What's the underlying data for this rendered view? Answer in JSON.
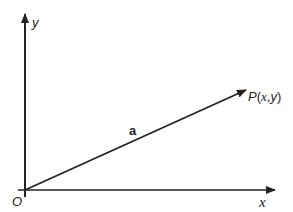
{
  "diagram": {
    "type": "vector-in-cartesian-plane",
    "colors": {
      "stroke": "#222222",
      "background": "#ffffff"
    },
    "axes": {
      "x": {
        "label": "x"
      },
      "y": {
        "label": "y"
      },
      "origin_label": "O"
    },
    "vector": {
      "label": "a",
      "from": "O",
      "to": "P"
    },
    "point": {
      "name": "P",
      "label": "P(x,y)",
      "label_p": "P",
      "label_open": "(",
      "label_x": "x",
      "label_comma": ",",
      "label_y": "y",
      "label_close": ")"
    }
  }
}
